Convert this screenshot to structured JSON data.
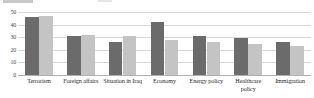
{
  "chart_data": {
    "type": "bar",
    "title": "",
    "subtitle": "",
    "xlabel": "",
    "ylabel": "",
    "ylim": [
      0,
      50
    ],
    "yticks": [
      0,
      10,
      20,
      30,
      40,
      50
    ],
    "grid": true,
    "legend_position": "none",
    "categories": [
      "Terrorism",
      "Foreign affairs",
      "Situation in Iraq",
      "Economy",
      "Energy policy",
      "Healthcare policy",
      "Immigration"
    ],
    "series": [
      {
        "name": "series-1",
        "color": "#6b6b6b",
        "values": [
          46,
          31,
          26,
          42,
          31,
          29,
          26
        ]
      },
      {
        "name": "series-2",
        "color": "#c4c4c4",
        "values": [
          47,
          32,
          31,
          28,
          26,
          25,
          23
        ]
      }
    ]
  },
  "axis": {
    "y_tick_labels": [
      "50",
      "40",
      "30",
      "20",
      "10",
      "0"
    ]
  },
  "colors": {
    "series_dark": "#6b6b6b",
    "series_light": "#c4c4c4",
    "gridline": "#d8d8d8",
    "baseline": "#b0b0b0",
    "text": "#2b2b2b"
  }
}
